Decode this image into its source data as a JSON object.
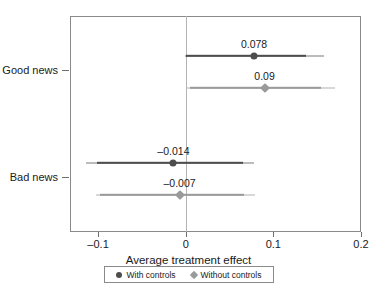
{
  "chart_data": {
    "type": "scatter",
    "title": "",
    "xlabel": "Average treatment effect",
    "ylabel": "",
    "xlim": [
      -0.132,
      0.2
    ],
    "xticks": [
      -0.1,
      0,
      0.1,
      0.2
    ],
    "xtick_labels": [
      "–0.1",
      "0",
      "0.1",
      "0.2"
    ],
    "categories": [
      "Good news",
      "Bad news"
    ],
    "grid": false,
    "zero_reference_line": 0,
    "legend_position": "below-axis",
    "legend": [
      {
        "label": "With controls",
        "marker": "circle",
        "color": "#4d4d4d"
      },
      {
        "label": "Without controls",
        "marker": "diamond",
        "color": "#9a9a9a"
      }
    ],
    "series": [
      {
        "name": "With controls",
        "marker": "circle",
        "color": "#4d4d4d",
        "points": [
          {
            "category": "Good news",
            "estimate": 0.078,
            "label": "0.078",
            "ci_inner_low": 0.0,
            "ci_inner_high": 0.137,
            "ci_outer_low": -0.001,
            "ci_outer_high": 0.158
          },
          {
            "category": "Bad news",
            "estimate": -0.014,
            "label": "–0.014",
            "ci_inner_low": -0.101,
            "ci_inner_high": 0.065,
            "ci_outer_low": -0.114,
            "ci_outer_high": 0.078
          }
        ]
      },
      {
        "name": "Without controls",
        "marker": "diamond",
        "color": "#9a9a9a",
        "points": [
          {
            "category": "Good news",
            "estimate": 0.09,
            "label": "0.09",
            "ci_inner_low": 0.005,
            "ci_inner_high": 0.154,
            "ci_outer_low": 0.001,
            "ci_outer_high": 0.17
          },
          {
            "category": "Bad news",
            "estimate": -0.007,
            "label": "–0.007",
            "ci_inner_low": -0.098,
            "ci_inner_high": 0.066,
            "ci_outer_low": -0.102,
            "ci_outer_high": 0.079
          }
        ]
      }
    ],
    "colors": {
      "with_controls": "#4d4d4d",
      "without_controls": "#9a9a9a",
      "frame": "#8a8a8a",
      "zero_line": "#b4b4b4",
      "background": "#ffffff"
    }
  }
}
